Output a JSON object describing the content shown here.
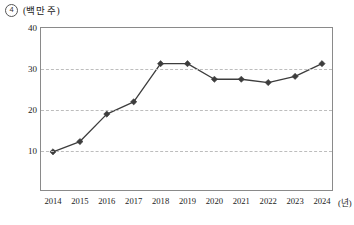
{
  "figure": {
    "number_marker": "4",
    "unit_label": "(백만 주)",
    "x_unit_label": "(년)"
  },
  "chart_data": {
    "type": "line",
    "title": "",
    "subtitle": "",
    "xlabel": "(년)",
    "ylabel": "(백만 주)",
    "categories": [
      "2014",
      "2015",
      "2016",
      "2017",
      "2018",
      "2019",
      "2020",
      "2021",
      "2022",
      "2023",
      "2024"
    ],
    "values": [
      9.8,
      12.3,
      19.0,
      22.0,
      31.3,
      31.3,
      27.5,
      27.5,
      26.7,
      28.2,
      31.3
    ],
    "series": [
      {
        "name": "발행 주식 수",
        "values": [
          9.8,
          12.3,
          19.0,
          22.0,
          31.3,
          31.3,
          27.5,
          27.5,
          26.7,
          28.2,
          31.3
        ]
      }
    ],
    "ylim": [
      0,
      40
    ],
    "yticks": [
      10,
      20,
      30,
      40
    ],
    "ytick_labels": [
      "10",
      "20",
      "30",
      "40"
    ],
    "xlim": [
      "2014",
      "2024"
    ],
    "grid": true,
    "grid_axis": "y",
    "grid_style": "dashed",
    "legend": false,
    "legend_position": "none",
    "marker": "diamond",
    "line_color": "#3d3d3d",
    "marker_color": "#3d3d3d",
    "grid_color": "#bdbdbd",
    "frame_color": "#8a8a8a"
  }
}
